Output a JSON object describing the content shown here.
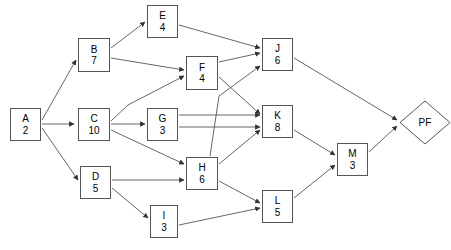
{
  "diagram": {
    "type": "activity-on-node network",
    "canvas": {
      "width": 451,
      "height": 250,
      "background": "#ffffff"
    },
    "style": {
      "node_fill": "#ffffff",
      "node_stroke": "#555555",
      "edge_stroke": "#555555",
      "text_color": "#000000"
    },
    "nodes": [
      {
        "id": "A",
        "label": "A",
        "duration": "2",
        "shape": "rect",
        "x": 10,
        "y": 108,
        "w": 31,
        "h": 33
      },
      {
        "id": "B",
        "label": "B",
        "duration": "7",
        "shape": "rect",
        "x": 78,
        "y": 38,
        "w": 32,
        "h": 34
      },
      {
        "id": "C",
        "label": "C",
        "duration": "10",
        "shape": "rect",
        "x": 78,
        "y": 108,
        "w": 32,
        "h": 33
      },
      {
        "id": "D",
        "label": "D",
        "duration": "5",
        "shape": "rect",
        "x": 80,
        "y": 166,
        "w": 31,
        "h": 33
      },
      {
        "id": "E",
        "label": "E",
        "duration": "4",
        "shape": "rect",
        "x": 147,
        "y": 5,
        "w": 31,
        "h": 33
      },
      {
        "id": "F",
        "label": "F",
        "duration": "4",
        "shape": "rect",
        "x": 186,
        "y": 56,
        "w": 32,
        "h": 34
      },
      {
        "id": "G",
        "label": "G",
        "duration": "3",
        "shape": "rect",
        "x": 147,
        "y": 108,
        "w": 31,
        "h": 33
      },
      {
        "id": "H",
        "label": "H",
        "duration": "6",
        "shape": "rect",
        "x": 186,
        "y": 157,
        "w": 32,
        "h": 33
      },
      {
        "id": "I",
        "label": "I",
        "duration": "3",
        "shape": "rect",
        "x": 150,
        "y": 205,
        "w": 28,
        "h": 33
      },
      {
        "id": "J",
        "label": "J",
        "duration": "6",
        "shape": "rect",
        "x": 262,
        "y": 38,
        "w": 31,
        "h": 33
      },
      {
        "id": "K",
        "label": "K",
        "duration": "8",
        "shape": "rect",
        "x": 262,
        "y": 105,
        "w": 31,
        "h": 33
      },
      {
        "id": "L",
        "label": "L",
        "duration": "5",
        "shape": "rect",
        "x": 262,
        "y": 190,
        "w": 31,
        "h": 33
      },
      {
        "id": "M",
        "label": "M",
        "duration": "3",
        "shape": "rect",
        "x": 337,
        "y": 143,
        "w": 31,
        "h": 33
      },
      {
        "id": "PF",
        "label": "PF",
        "duration": "",
        "shape": "diamond",
        "x": 399,
        "y": 100,
        "w": 52,
        "h": 45
      }
    ],
    "edges": [
      {
        "from": "A",
        "to": "B",
        "points": "42,120 76,60"
      },
      {
        "from": "A",
        "to": "C",
        "points": "42,124 74,124"
      },
      {
        "from": "A",
        "to": "D",
        "points": "42,128 78,180"
      },
      {
        "from": "B",
        "to": "E",
        "points": "111,48 145,22"
      },
      {
        "from": "B",
        "to": "F",
        "points": "111,58 184,70"
      },
      {
        "from": "C",
        "to": "F",
        "points": "111,121 128,105 184,76"
      },
      {
        "from": "C",
        "to": "G",
        "points": "111,124 145,124"
      },
      {
        "from": "C",
        "to": "H",
        "points": "111,130 184,164"
      },
      {
        "from": "D",
        "to": "H",
        "points": "112,180 184,180"
      },
      {
        "from": "D",
        "to": "I",
        "points": "112,188 148,218"
      },
      {
        "from": "E",
        "to": "J",
        "points": "179,25 260,48"
      },
      {
        "from": "F",
        "to": "J",
        "points": "219,62 260,53"
      },
      {
        "from": "F",
        "to": "K",
        "points": "219,77 260,114"
      },
      {
        "from": "G",
        "to": "K",
        "points": "179,115 260,115"
      },
      {
        "from": "G",
        "to": "K2",
        "points": "179,127 260,127"
      },
      {
        "from": "H",
        "to": "J",
        "points": "210,156 219,96 260,66"
      },
      {
        "from": "H",
        "to": "K",
        "points": "219,164 260,130"
      },
      {
        "from": "H",
        "to": "L",
        "points": "219,181 260,203"
      },
      {
        "from": "I",
        "to": "L",
        "points": "179,225 260,208"
      },
      {
        "from": "J",
        "to": "PF",
        "points": "294,58 397,120"
      },
      {
        "from": "K",
        "to": "M",
        "points": "294,130 335,155"
      },
      {
        "from": "L",
        "to": "M",
        "points": "294,198 335,165"
      },
      {
        "from": "M",
        "to": "PF",
        "points": "369,152 397,126"
      }
    ]
  }
}
